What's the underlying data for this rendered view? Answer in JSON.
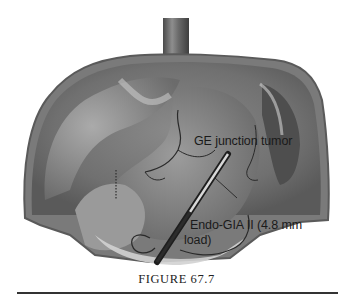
{
  "figure": {
    "caption": "FIGURE 67.7",
    "palette": {
      "background": "#ffffff",
      "tissue_dark": "#5e5e5e",
      "tissue_mid": "#8c8c8c",
      "tissue_light": "#c4c4c4",
      "text": "#1a1a1a"
    },
    "annotations": [
      {
        "id": "ge-junction",
        "text": "GE junction tumor"
      },
      {
        "id": "stapler-line1",
        "text": "Endo-GIA II (4.8 mm"
      },
      {
        "id": "stapler-line2",
        "text": "load)"
      }
    ]
  }
}
